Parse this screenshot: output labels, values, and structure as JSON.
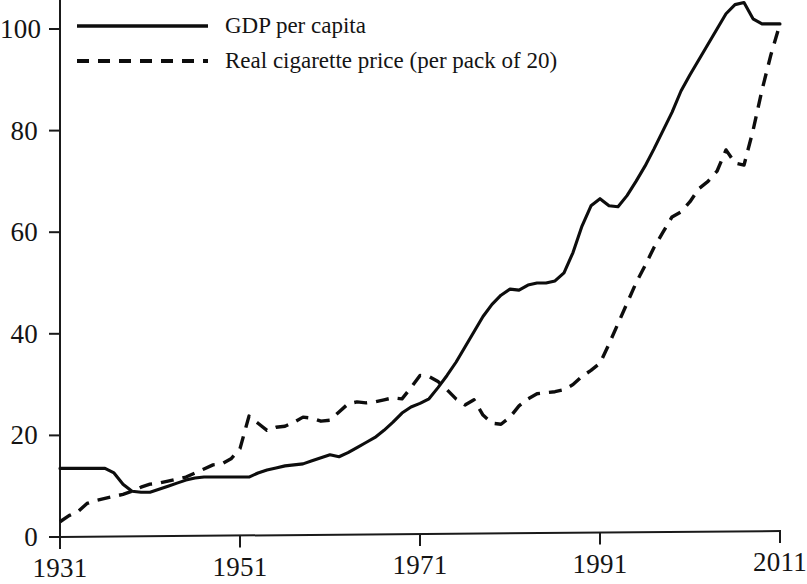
{
  "chart_data": {
    "type": "line",
    "title": "",
    "subtitle": "",
    "xlabel": "",
    "ylabel": "",
    "xlim": [
      1931,
      2011
    ],
    "ylim": [
      0,
      108
    ],
    "grid": false,
    "legend_position": "top-left",
    "x_ticks": [
      "1931",
      "1951",
      "1971",
      "1991",
      "2011"
    ],
    "x_tick_values": [
      1931,
      1951,
      1971,
      1991,
      2011
    ],
    "y_ticks": [
      "0",
      "20",
      "40",
      "60",
      "80",
      "100"
    ],
    "y_tick_values": [
      0,
      20,
      40,
      60,
      80,
      100
    ],
    "x": [
      1931,
      1932,
      1933,
      1934,
      1935,
      1936,
      1937,
      1938,
      1939,
      1940,
      1941,
      1942,
      1943,
      1944,
      1945,
      1946,
      1947,
      1948,
      1949,
      1950,
      1951,
      1952,
      1953,
      1954,
      1955,
      1956,
      1957,
      1958,
      1959,
      1960,
      1961,
      1962,
      1963,
      1964,
      1965,
      1966,
      1967,
      1968,
      1969,
      1970,
      1971,
      1972,
      1973,
      1974,
      1975,
      1976,
      1977,
      1978,
      1979,
      1980,
      1981,
      1982,
      1983,
      1984,
      1985,
      1986,
      1987,
      1988,
      1989,
      1990,
      1991,
      1992,
      1993,
      1994,
      1995,
      1996,
      1997,
      1998,
      1999,
      2000,
      2001,
      2002,
      2003,
      2004,
      2005,
      2006,
      2007,
      2008,
      2009,
      2010,
      2011
    ],
    "series": [
      {
        "name": "GDP per capita",
        "style": "solid",
        "color": "#0d0d0d",
        "values": [
          13.5,
          13.5,
          13.5,
          13.5,
          13.5,
          13.5,
          12.6,
          10.4,
          9.0,
          8.8,
          8.8,
          9.4,
          10.0,
          10.6,
          11.2,
          11.6,
          11.8,
          11.8,
          11.8,
          11.8,
          11.8,
          11.8,
          12.6,
          13.2,
          13.6,
          14.0,
          14.2,
          14.4,
          15.0,
          15.6,
          16.2,
          15.8,
          16.6,
          17.6,
          18.6,
          19.6,
          21.0,
          22.6,
          24.4,
          25.6,
          26.3,
          27.2,
          29.4,
          31.8,
          34.4,
          37.4,
          40.4,
          43.4,
          45.8,
          47.6,
          48.8,
          48.6,
          49.6,
          50.0,
          50.0,
          50.4,
          52.0,
          56.0,
          61.2,
          65.2,
          66.6,
          65.2,
          65.0,
          67.2,
          70.0,
          73.0,
          76.4,
          80.0,
          83.6,
          87.8,
          91.0,
          94.0,
          97.0,
          100.0,
          103.0,
          104.8,
          105.2,
          102.0,
          101.0,
          101.0,
          101.0
        ]
      },
      {
        "name": "Real cigarette price (per pack of 20)",
        "style": "dashed",
        "color": "#0d0d0d",
        "values": [
          3.0,
          4.2,
          5.0,
          6.6,
          7.2,
          7.6,
          8.0,
          8.4,
          9.0,
          9.8,
          10.4,
          10.6,
          11.0,
          11.4,
          11.8,
          12.6,
          13.4,
          14.2,
          14.4,
          15.4,
          17.4,
          23.8,
          22.4,
          21.0,
          21.6,
          21.8,
          22.6,
          23.6,
          23.4,
          22.8,
          23.0,
          24.6,
          26.2,
          26.6,
          26.4,
          26.6,
          27.0,
          27.4,
          27.2,
          29.4,
          31.8,
          31.6,
          30.6,
          29.0,
          27.2,
          26.0,
          27.0,
          24.0,
          22.4,
          22.2,
          23.6,
          25.8,
          27.2,
          28.2,
          28.4,
          28.6,
          29.0,
          30.0,
          31.6,
          32.8,
          34.2,
          38.0,
          42.0,
          46.0,
          50.0,
          53.4,
          57.0,
          60.0,
          63.0,
          64.0,
          66.0,
          68.6,
          70.0,
          72.0,
          76.2,
          73.6,
          73.2,
          80.0,
          88.0,
          95.0,
          101.0
        ]
      }
    ],
    "legend": [
      {
        "label": "GDP per capita",
        "style": "solid"
      },
      {
        "label": "Real cigarette price (per pack of 20)",
        "style": "dashed"
      }
    ]
  },
  "plot_geometry": {
    "x0_px": 60,
    "x1_px": 780,
    "y0_px": 537,
    "y100_px": 29
  }
}
